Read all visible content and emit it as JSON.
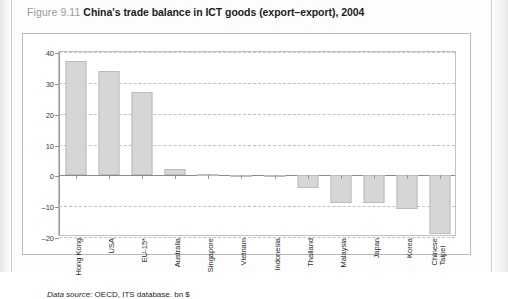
{
  "figure": {
    "number": "Figure 9.11",
    "title": "China's trade balance in ICT goods (export–export), 2004",
    "source_label": "Data source:",
    "source_text": "OECD, ITS database. bn $"
  },
  "chart_data": {
    "type": "bar",
    "title": "China's trade balance in ICT goods (export–export), 2004",
    "xlabel": "",
    "ylabel": "",
    "unit": "bn $",
    "ylim": [
      -20,
      40
    ],
    "yticks": [
      40,
      30,
      20,
      10,
      0,
      -10,
      -20
    ],
    "ytick_labels": [
      "40",
      "30",
      "20",
      "10",
      "0",
      "–10",
      "–20"
    ],
    "grid": true,
    "legend": "none",
    "categories": [
      "Hong Kong",
      "USA",
      "EU-15*",
      "Australia",
      "Singapore",
      "Vietnam",
      "Indonesia",
      "Thailand",
      "Malaysia",
      "Japan",
      "Korea",
      "Chinese Taipei"
    ],
    "values": [
      37,
      34,
      27,
      2,
      0.3,
      0.2,
      -0.5,
      -4,
      -9,
      -9,
      -11,
      -19
    ],
    "bar_color": "#d6d6d6",
    "bar_border_color": "#bcbcbc"
  }
}
